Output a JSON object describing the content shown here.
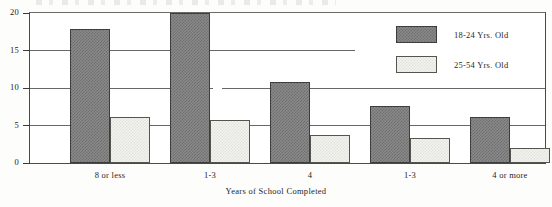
{
  "chart_data": {
    "type": "bar",
    "title": "",
    "xlabel": "Years of School Completed",
    "ylabel": "",
    "categories": [
      "8 or less",
      "1-3",
      "4",
      "1-3",
      "4 or more"
    ],
    "series": [
      {
        "name": "18-24 Yrs. Old",
        "values": [
          17.9,
          20.0,
          10.8,
          7.6,
          6.1
        ]
      },
      {
        "name": "25-54 Yrs. Old",
        "values": [
          6.2,
          5.8,
          3.7,
          3.4,
          2.0
        ]
      }
    ],
    "ylim": [
      0,
      20
    ],
    "yticks": [
      "0",
      "5",
      "10",
      "15",
      "20"
    ],
    "grid": true,
    "legend_position": "top-right",
    "colors": {
      "series_1": "#7a7a7a",
      "series_2": "#ededea",
      "axis": "#3d3d3d",
      "gridline": "#676767"
    }
  },
  "axis": {
    "y_ticks": [
      {
        "label": "20",
        "value": 20
      },
      {
        "label": "15",
        "value": 15
      },
      {
        "label": "10",
        "value": 10
      },
      {
        "label": "5",
        "value": 5
      },
      {
        "label": "0",
        "value": 0
      }
    ],
    "x_title": "Years of School Completed"
  },
  "legend": {
    "items": [
      {
        "label": "18-24 Yrs. Old",
        "swatch": "dark-checker"
      },
      {
        "label": "25-54 Yrs. Old",
        "swatch": "light-checker"
      }
    ]
  }
}
